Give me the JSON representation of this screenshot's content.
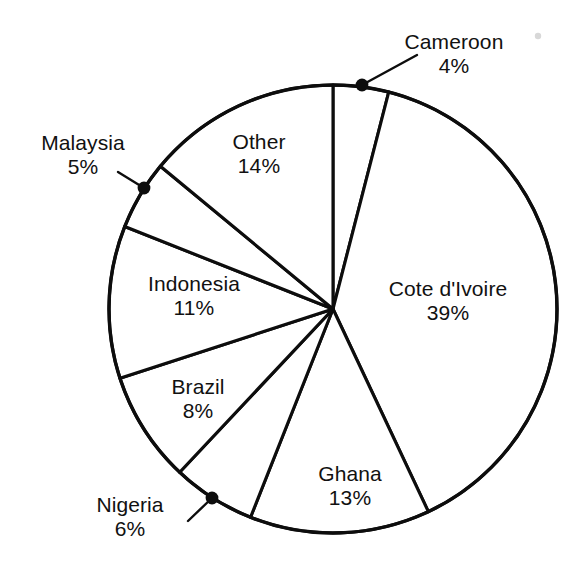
{
  "chart_data": {
    "type": "pie",
    "title": "",
    "subtitle": "",
    "xlabel": "",
    "ylabel": "",
    "legend_position": "none",
    "grid": false,
    "value_unit": "%",
    "total": 100,
    "categories": [
      "Cameroon",
      "Cote d'Ivoire",
      "Ghana",
      "Nigeria",
      "Brazil",
      "Indonesia",
      "Malaysia",
      "Other"
    ],
    "values": [
      4,
      39,
      13,
      6,
      8,
      11,
      5,
      14
    ],
    "slices": [
      {
        "name": "Cameroon",
        "value": 4,
        "value_text": "4%",
        "label_placement": "outside",
        "has_leader_line": true,
        "has_boundary_dot": true,
        "label_x": 454,
        "label_y": 30,
        "dot_x": 362,
        "dot_y": 85,
        "leader_from_x": 417,
        "leader_from_y": 55
      },
      {
        "name": "Cote d'Ivoire",
        "value": 39,
        "value_text": "39%",
        "label_placement": "inside",
        "has_leader_line": false,
        "has_boundary_dot": false,
        "label_x": 448,
        "label_y": 277
      },
      {
        "name": "Ghana",
        "value": 13,
        "value_text": "13%",
        "label_placement": "inside",
        "has_leader_line": false,
        "has_boundary_dot": false,
        "label_x": 350,
        "label_y": 462
      },
      {
        "name": "Nigeria",
        "value": 6,
        "value_text": "6%",
        "label_placement": "outside",
        "has_leader_line": true,
        "has_boundary_dot": true,
        "label_x": 130,
        "label_y": 493,
        "dot_x": 212,
        "dot_y": 498,
        "leader_from_x": 188,
        "leader_from_y": 521
      },
      {
        "name": "Brazil",
        "value": 8,
        "value_text": "8%",
        "label_placement": "inside",
        "label_x": 198,
        "label_y": 375,
        "has_leader_line": false,
        "has_boundary_dot": false
      },
      {
        "name": "Indonesia",
        "value": 11,
        "value_text": "11%",
        "label_placement": "inside",
        "label_x": 194,
        "label_y": 272,
        "has_leader_line": false,
        "has_boundary_dot": false
      },
      {
        "name": "Malaysia",
        "value": 5,
        "value_text": "5%",
        "label_placement": "outside",
        "has_leader_line": true,
        "has_boundary_dot": true,
        "label_x": 83,
        "label_y": 131,
        "dot_x": 144,
        "dot_y": 188,
        "leader_from_x": 118,
        "leader_from_y": 172
      },
      {
        "name": "Other",
        "value": 14,
        "value_text": "14%",
        "label_placement": "inside",
        "label_x": 259,
        "label_y": 130,
        "has_leader_line": false,
        "has_boundary_dot": false
      }
    ],
    "geometry": {
      "center_x": 333,
      "center_y": 309,
      "radius": 224,
      "start_angle_deg": -90,
      "direction": "clockwise"
    },
    "colors": {
      "slice_fill": "#ffffff",
      "slice_stroke": "#0d0d0d",
      "text": "#111111",
      "background": "#ffffff"
    }
  },
  "artifacts": {
    "speck": {
      "x": 538,
      "y": 36
    }
  }
}
